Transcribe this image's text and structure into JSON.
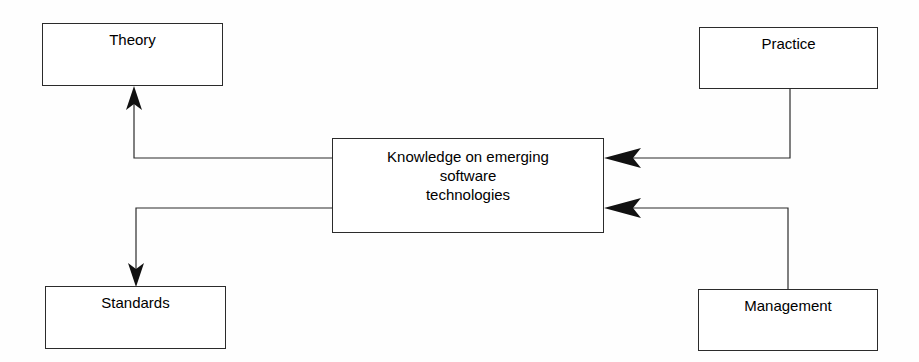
{
  "diagram": {
    "background_color": "#fefefe",
    "line_color": "#2b2b2b",
    "text_color": "#000000",
    "nodes": {
      "theory": {
        "label": "Theory"
      },
      "practice": {
        "label": "Practice"
      },
      "center": {
        "label": "Knowledge on emerging\nsoftware\ntechnologies"
      },
      "standards": {
        "label": "Standards"
      },
      "management": {
        "label": "Management"
      }
    },
    "connectors": [
      {
        "name": "center-to-theory",
        "from": "center",
        "to": "theory",
        "direction": "up",
        "arrowhead": "at-target"
      },
      {
        "name": "center-to-standards",
        "from": "center",
        "to": "standards",
        "direction": "down",
        "arrowhead": "at-target"
      },
      {
        "name": "practice-to-center",
        "from": "practice",
        "to": "center",
        "direction": "left",
        "arrowhead": "at-target"
      },
      {
        "name": "management-to-center",
        "from": "management",
        "to": "center",
        "direction": "left",
        "arrowhead": "at-target"
      }
    ]
  }
}
